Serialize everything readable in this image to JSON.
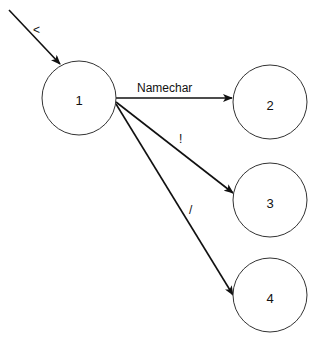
{
  "diagram": {
    "type": "state-diagram",
    "nodes": [
      {
        "id": "1",
        "label": "1",
        "cx": 79,
        "cy": 98,
        "r": 37
      },
      {
        "id": "2",
        "label": "2",
        "cx": 270,
        "cy": 102,
        "r": 37
      },
      {
        "id": "3",
        "label": "3",
        "cx": 270,
        "cy": 200,
        "r": 37
      },
      {
        "id": "4",
        "label": "4",
        "cx": 270,
        "cy": 295,
        "r": 37
      }
    ],
    "edges": [
      {
        "from": "start",
        "to": "1",
        "label": "<"
      },
      {
        "from": "1",
        "to": "2",
        "label": "Namechar"
      },
      {
        "from": "1",
        "to": "3",
        "label": "!"
      },
      {
        "from": "1",
        "to": "4",
        "label": "/"
      }
    ]
  }
}
